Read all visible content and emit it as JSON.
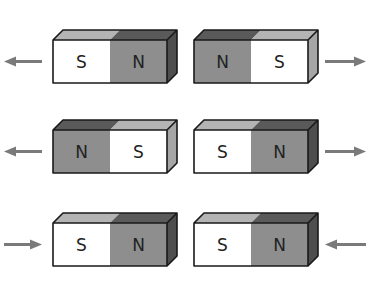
{
  "colors": {
    "north_front": "#8e8e8e",
    "north_top": "#5a5a5a",
    "north_side": "#4e4e4e",
    "south_front": "#ffffff",
    "south_top": "#b4b4b4",
    "south_side": "#a6a6a6",
    "outline": "#1a1a1a",
    "arrow": "#7a7a7a"
  },
  "rows": [
    {
      "magnets": [
        {
          "left": "S",
          "right": "N"
        },
        {
          "left": "N",
          "right": "S"
        }
      ],
      "arrows": {
        "left": "pointing-left",
        "right": "pointing-right"
      }
    },
    {
      "magnets": [
        {
          "left": "N",
          "right": "S"
        },
        {
          "left": "S",
          "right": "N"
        }
      ],
      "arrows": {
        "left": "pointing-left",
        "right": "pointing-right"
      }
    },
    {
      "magnets": [
        {
          "left": "S",
          "right": "N"
        },
        {
          "left": "S",
          "right": "N"
        }
      ],
      "arrows": {
        "left": "pointing-right",
        "right": "pointing-left"
      }
    }
  ]
}
